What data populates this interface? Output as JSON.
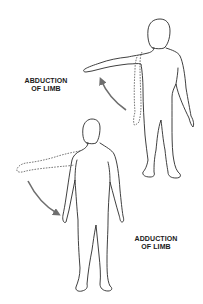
{
  "diagram": {
    "figures": [
      {
        "id": "upper-figure",
        "label_line1": "ABDUCTION",
        "label_line2": "OF LIMB",
        "motion": "arm raised away from body",
        "arrow_color": "#6e6e6e"
      },
      {
        "id": "lower-figure",
        "label_line1": "ADDUCTION",
        "label_line2": "OF LIMB",
        "motion": "arm lowered toward body",
        "arrow_color": "#6e6e6e"
      }
    ],
    "colors": {
      "outline": "#2a2a2a",
      "dashed_outline": "#555555",
      "arrow": "#6e6e6e",
      "background": "#ffffff"
    }
  }
}
